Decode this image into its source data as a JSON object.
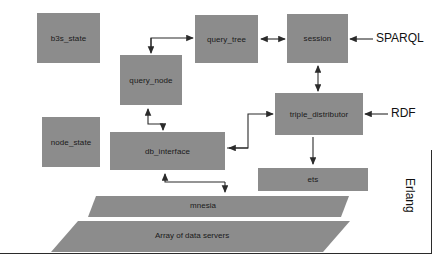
{
  "diagram": {
    "type": "block-diagram",
    "box_color": "#8c8c8c",
    "line_color": "#2b2b2b",
    "background": "#ffffff"
  },
  "nodes": [
    {
      "id": "b3s_state",
      "label": "b3s_state",
      "x": 37,
      "y": 13,
      "w": 63,
      "h": 50
    },
    {
      "id": "query_tree",
      "label": "query_tree",
      "x": 195,
      "y": 15,
      "w": 63,
      "h": 48
    },
    {
      "id": "session",
      "label": "session",
      "x": 287,
      "y": 14,
      "w": 61,
      "h": 49
    },
    {
      "id": "query_node",
      "label": "query_node",
      "x": 120,
      "y": 55,
      "w": 62,
      "h": 50
    },
    {
      "id": "triple_distributor",
      "label": "triple_distributor",
      "x": 275,
      "y": 93,
      "w": 88,
      "h": 42
    },
    {
      "id": "node_state",
      "label": "node_state",
      "x": 42,
      "y": 117,
      "w": 58,
      "h": 50
    },
    {
      "id": "db_interface",
      "label": "db_interface",
      "x": 110,
      "y": 132,
      "w": 115,
      "h": 38
    },
    {
      "id": "ets",
      "label": "ets",
      "x": 258,
      "y": 168,
      "w": 110,
      "h": 23
    }
  ],
  "slabs": [
    {
      "id": "mnesia",
      "label": "mnesia",
      "cx": 203,
      "cy": 206
    },
    {
      "id": "array_of_data_servers",
      "label": "Array of data servers",
      "cx": 192,
      "cy": 236
    }
  ],
  "external_labels": [
    {
      "id": "sparql",
      "label": "SPARQL",
      "x": 376,
      "y": 25
    },
    {
      "id": "rdf",
      "label": "RDF",
      "x": 391,
      "y": 107
    }
  ],
  "frame": {
    "id": "erlang",
    "label": "Erlang"
  },
  "edges": [
    {
      "from": "query_node",
      "to": "query_tree",
      "style": "elbow-split",
      "arrows": "both-ends"
    },
    {
      "from": "query_tree",
      "to": "session",
      "style": "straight",
      "arrows": "double"
    },
    {
      "from": "session",
      "to": "triple_distributor",
      "style": "vertical",
      "arrows": "double"
    },
    {
      "from": "query_node",
      "to": "db_interface",
      "style": "elbow-split",
      "arrows": "both-ends"
    },
    {
      "from": "db_interface",
      "to": "triple_distributor",
      "style": "elbow",
      "arrows": "both-ends"
    },
    {
      "from": "triple_distributor",
      "to": "ets",
      "style": "elbow",
      "arrows": "single"
    },
    {
      "from": "db_interface",
      "to": "mnesia",
      "style": "elbow-split",
      "arrows": "both-ends"
    },
    {
      "from": "sparql",
      "to": "session",
      "style": "straight",
      "arrows": "single"
    },
    {
      "from": "rdf",
      "to": "triple_distributor",
      "style": "straight",
      "arrows": "single"
    }
  ]
}
